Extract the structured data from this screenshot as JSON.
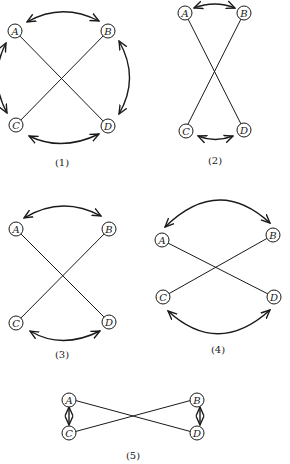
{
  "figures": [
    {
      "caption": "(1)",
      "nodes": {
        "A": "A",
        "B": "B",
        "C": "C",
        "D": "D"
      },
      "edges": [
        "A-D",
        "B-C"
      ],
      "arcs": [
        "A<->B",
        "B<->D",
        "D<->C",
        "C<->A"
      ]
    },
    {
      "caption": "(2)",
      "nodes": {
        "A": "A",
        "B": "B",
        "C": "C",
        "D": "D"
      },
      "edges": [
        "A-D",
        "B-C"
      ],
      "arcs": [
        "A<->B",
        "C<->D"
      ]
    },
    {
      "caption": "(3)",
      "nodes": {
        "A": "A",
        "B": "B",
        "C": "C",
        "D": "D"
      },
      "edges": [
        "A-D",
        "B-C"
      ],
      "arcs": [
        "A<->B",
        "C<->D"
      ]
    },
    {
      "caption": "(4)",
      "nodes": {
        "A": "A",
        "B": "B",
        "C": "C",
        "D": "D"
      },
      "edges": [
        "A-D",
        "B-C"
      ],
      "arcs": [
        "A<->B",
        "C<->D"
      ]
    },
    {
      "caption": "(5)",
      "nodes": {
        "A": "A",
        "B": "B",
        "C": "C",
        "D": "D"
      },
      "edges": [
        "A-D",
        "B-C"
      ],
      "arcs": [
        "A<->C",
        "B<->D"
      ]
    }
  ]
}
